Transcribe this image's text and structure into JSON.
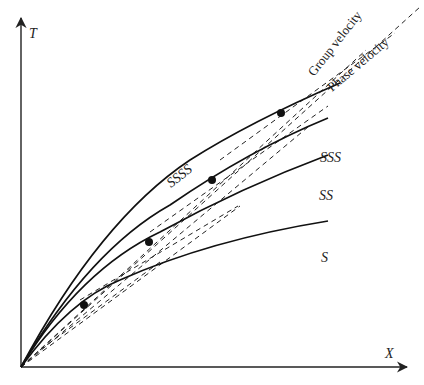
{
  "diagram": {
    "axes": {
      "y_label": "T",
      "x_label": "X",
      "color": "#222222"
    },
    "curves": [
      {
        "id": "s",
        "label": "S",
        "tangent_point": [
          84,
          305
        ]
      },
      {
        "id": "ss",
        "label": "SS",
        "tangent_point": [
          149,
          242
        ]
      },
      {
        "id": "sss",
        "label": "SSS",
        "tangent_point": [
          212,
          180
        ]
      },
      {
        "id": "ssss",
        "label": "SSSS",
        "tangent_point": [
          281,
          113
        ]
      }
    ],
    "annotations": {
      "group_velocity": "Group velocity",
      "phase_velocity": "Phase velocity"
    },
    "line_styles": {
      "curve": "solid",
      "tangent": "dashed"
    }
  }
}
